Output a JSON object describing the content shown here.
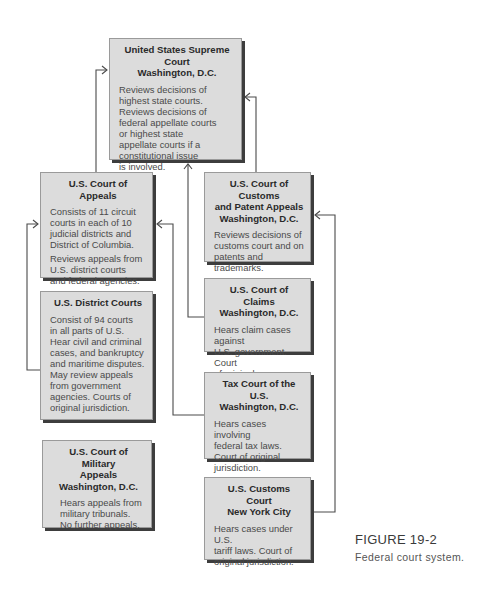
{
  "diagram": {
    "type": "hierarchy",
    "nodes": [
      {
        "id": "supreme",
        "title": "United States Supreme Court\nWashington, D.C.",
        "desc": [
          "Reviews decisions of\nhighest state courts.\nReviews decisions of\nfederal appellate courts\nor highest state\nappellate courts if a\nconstitutional issue\nis involved."
        ]
      },
      {
        "id": "appeals",
        "title": "U.S. Court of Appeals",
        "desc": [
          "Consists of 11 circuit\ncourts in each of 10\njudicial districts and\nDistrict of Columbia.",
          "Reviews appeals from\nU.S. district courts\nand federal agencies."
        ]
      },
      {
        "id": "district",
        "title": "U.S. District Courts",
        "desc": [
          "Consist of 94 courts\nin all parts of U.S.\nHear civil and criminal\ncases, and bankruptcy\nand maritime disputes.\nMay review appeals\nfrom government\nagencies.  Courts of\noriginal jurisdiction."
        ]
      },
      {
        "id": "military",
        "title": "U.S. Court of Military\nAppeals\nWashington, D.C.",
        "desc": [
          "Hears appeals from\nmilitary tribunals.\nNo further appeals."
        ]
      },
      {
        "id": "customs_patent",
        "title": "U.S. Court of Customs\nand Patent Appeals\nWashington, D.C.",
        "desc": [
          "Reviews decisions of\ncustoms court and on\npatents and trademarks."
        ]
      },
      {
        "id": "claims",
        "title": "U.S. Court of Claims\nWashington, D.C.",
        "desc": [
          "Hears claim cases against\nU.S. government.  Court\nof original jurisdiction."
        ]
      },
      {
        "id": "tax",
        "title": "Tax Court of the U.S.\nWashington, D.C.",
        "desc": [
          "Hears cases involving\nfederal tax laws.\nCourt of original\njurisdiction."
        ]
      },
      {
        "id": "customs",
        "title": "U.S. Customs Court\nNew York City",
        "desc": [
          "Hears cases under U.S.\ntariff laws.  Court of\noriginal jurisdiction."
        ]
      }
    ],
    "edges": [
      {
        "from": "appeals",
        "to": "supreme"
      },
      {
        "from": "district",
        "to": "appeals"
      },
      {
        "from": "customs_patent",
        "to": "supreme"
      },
      {
        "from": "claims",
        "to": "supreme"
      },
      {
        "from": "tax",
        "to": "appeals"
      },
      {
        "from": "customs",
        "to": "customs_patent"
      }
    ]
  },
  "caption": {
    "figure": "FIGURE 19-2",
    "text": "Federal court system."
  }
}
